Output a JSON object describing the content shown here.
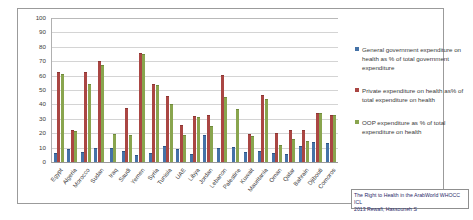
{
  "chart_data": {
    "type": "bar",
    "title": "",
    "xlabel": "",
    "ylabel": "",
    "ylim": [
      0,
      100
    ],
    "ytick_step": 10,
    "grid": true,
    "legend_position": "right",
    "yticks": [
      "100",
      "90",
      "80",
      "70",
      "60",
      "50",
      "40",
      "30",
      "20",
      "10",
      "0"
    ],
    "categories": [
      "Egypt",
      "Algeria",
      "Morocco",
      "Sudan",
      "Iraq",
      "Saudi",
      "Yemen",
      "Syria",
      "Tunisia",
      "UAE",
      "Libya",
      "Jordan",
      "Lebanon",
      "Palestine",
      "Kuwait",
      "Mauritania",
      "Oman",
      "Qatar",
      "Bahrain",
      "Djibouti",
      "Comoros"
    ],
    "series": [
      {
        "name": "General government expenditure on health as % of total government expenditure",
        "color": "#4572a7",
        "values": [
          5.5,
          8.0,
          6.3,
          9.3,
          8.7,
          6.7,
          4.0,
          5.3,
          10.2,
          8.4,
          5.1,
          18.2,
          9.2,
          9.5,
          6.5,
          6.7,
          5.7,
          4.7,
          10.2,
          13.2,
          12.2
        ]
      },
      {
        "name": "Private expenditure on health as% of total expenditure on health",
        "color": "#aa4643",
        "values": [
          62.0,
          21.7,
          61.7,
          69.5,
          0.0,
          36.7,
          74.9,
          53.2,
          45.0,
          25.0,
          31.2,
          31.8,
          60.0,
          0.0,
          19.0,
          46.0,
          19.3,
          21.7,
          21.8,
          33.6,
          32.0
        ]
      },
      {
        "name": "OOP expenditure as % of total expenditure on health",
        "color": "#89a54e",
        "values": [
          60.5,
          20.7,
          53.6,
          66.4,
          18.5,
          18.3,
          74.0,
          53.0,
          39.4,
          18.3,
          30.5,
          24.2,
          44.2,
          36.2,
          17.4,
          43.3,
          11.1,
          15.2,
          13.7,
          33.3,
          32.0
        ]
      }
    ]
  },
  "legend": {
    "items": [
      {
        "label": "General government expenditure on health as % of total government expenditure"
      },
      {
        "label": "Private expenditure on health as% of total expenditure on health"
      },
      {
        "label": "OOP expenditure as % of total expenditure on health"
      }
    ]
  },
  "caption": {
    "line1": "The Right to Health in the ArabWorld WHOCC ICL",
    "line2": "2013 Rewafi, Hassouneh S"
  }
}
